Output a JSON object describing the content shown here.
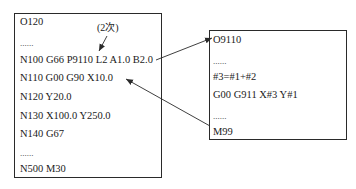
{
  "main_program": {
    "lines": [
      "O120",
      "......",
      "N100 G66 P9110 L2 A1.0 B2.0",
      "N110 G00 G90 X10.0",
      "N120 Y20.0",
      "N130 X100.0 Y250.0",
      "N140 G67",
      "......",
      "N500 M30"
    ],
    "annotation": "(2次)"
  },
  "macro_program": {
    "lines": [
      "O9110",
      "......",
      "#3=#1+#2",
      "G00 G911 X#3 Y#1",
      "......",
      "M99"
    ]
  },
  "arrows": [
    {
      "from": "N100 G66 P9110 L2 A1.0 B2.0",
      "to": "O9110",
      "meaning": "call"
    },
    {
      "from": "M99",
      "to": "N110 G00 G90 X10.0",
      "meaning": "return"
    }
  ],
  "colors": {
    "stroke": "#2a2a2a",
    "text": "#1a1a1a",
    "background": "#ffffff"
  }
}
